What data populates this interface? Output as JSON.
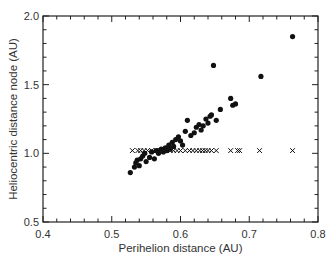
{
  "chart_data": {
    "type": "scatter",
    "title": "",
    "xlabel": "Perihelion distance (AU)",
    "ylabel": "Heliocentric distance node (AU)",
    "xlim": [
      0.4,
      0.8
    ],
    "ylim": [
      0.5,
      2.0
    ],
    "xticks": [
      0.4,
      0.5,
      0.6,
      0.7,
      0.8
    ],
    "xtick_labels": [
      "0.4",
      "0.5",
      "0.6",
      "0.7",
      "0.8"
    ],
    "yticks": [
      0.5,
      1.0,
      1.5,
      2.0
    ],
    "ytick_labels": [
      "0.5",
      "1.0",
      "1.5",
      "2.0"
    ],
    "x_minor_step": 0.02,
    "y_minor_step": 0.1,
    "grid": false,
    "legend": null,
    "series": [
      {
        "name": "node distance (dots)",
        "marker": "filled-circle",
        "color": "#111111",
        "points": [
          [
            0.527,
            0.86
          ],
          [
            0.533,
            0.9
          ],
          [
            0.535,
            0.93
          ],
          [
            0.537,
            0.95
          ],
          [
            0.54,
            0.91
          ],
          [
            0.542,
            0.96
          ],
          [
            0.545,
            0.98
          ],
          [
            0.548,
            1.0
          ],
          [
            0.55,
            0.94
          ],
          [
            0.555,
            0.97
          ],
          [
            0.558,
            1.01
          ],
          [
            0.562,
            0.96
          ],
          [
            0.565,
            1.02
          ],
          [
            0.568,
            1.0
          ],
          [
            0.572,
            1.03
          ],
          [
            0.575,
            1.01
          ],
          [
            0.578,
            1.04
          ],
          [
            0.58,
            1.02
          ],
          [
            0.583,
            1.06
          ],
          [
            0.585,
            1.03
          ],
          [
            0.588,
            1.08
          ],
          [
            0.59,
            1.05
          ],
          [
            0.593,
            1.1
          ],
          [
            0.597,
            1.12
          ],
          [
            0.6,
            1.09
          ],
          [
            0.603,
            1.06
          ],
          [
            0.607,
            1.16
          ],
          [
            0.61,
            1.24
          ],
          [
            0.615,
            1.13
          ],
          [
            0.62,
            1.15
          ],
          [
            0.623,
            1.19
          ],
          [
            0.627,
            1.21
          ],
          [
            0.63,
            1.17
          ],
          [
            0.633,
            1.2
          ],
          [
            0.637,
            1.25
          ],
          [
            0.64,
            1.22
          ],
          [
            0.643,
            1.27
          ],
          [
            0.645,
            1.28
          ],
          [
            0.648,
            1.64
          ],
          [
            0.652,
            1.24
          ],
          [
            0.658,
            1.32
          ],
          [
            0.673,
            1.4
          ],
          [
            0.676,
            1.35
          ],
          [
            0.68,
            1.36
          ],
          [
            0.717,
            1.56
          ],
          [
            0.763,
            1.85
          ]
        ]
      },
      {
        "name": "reference (crosses)",
        "marker": "x",
        "color": "#111111",
        "points": [
          [
            0.53,
            1.02
          ],
          [
            0.538,
            1.02
          ],
          [
            0.542,
            1.02
          ],
          [
            0.547,
            1.02
          ],
          [
            0.552,
            1.02
          ],
          [
            0.558,
            1.02
          ],
          [
            0.565,
            1.02
          ],
          [
            0.57,
            1.02
          ],
          [
            0.575,
            1.02
          ],
          [
            0.58,
            1.02
          ],
          [
            0.585,
            1.02
          ],
          [
            0.59,
            1.02
          ],
          [
            0.595,
            1.02
          ],
          [
            0.6,
            1.02
          ],
          [
            0.607,
            1.02
          ],
          [
            0.613,
            1.02
          ],
          [
            0.618,
            1.02
          ],
          [
            0.623,
            1.02
          ],
          [
            0.628,
            1.02
          ],
          [
            0.632,
            1.02
          ],
          [
            0.636,
            1.02
          ],
          [
            0.64,
            1.02
          ],
          [
            0.645,
            1.02
          ],
          [
            0.652,
            1.02
          ],
          [
            0.673,
            1.02
          ],
          [
            0.683,
            1.02
          ],
          [
            0.686,
            1.02
          ],
          [
            0.715,
            1.02
          ],
          [
            0.763,
            1.02
          ]
        ]
      }
    ]
  },
  "labels": {
    "xlabel": "Perihelion distance (AU)",
    "ylabel": "Heliocentric distance node (AU)"
  }
}
